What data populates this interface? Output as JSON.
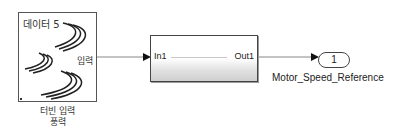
{
  "diagram": {
    "source_block": {
      "title": "데이터 5",
      "port_label": "입력",
      "caption_line1": "터빈 입력",
      "caption_line2": "풍력",
      "icon": "wind-icon"
    },
    "subsystem_block": {
      "input_port": "In1",
      "output_port": "Out1"
    },
    "outport_block": {
      "number": "1",
      "name": "Motor_Speed_Reference"
    },
    "colors": {
      "wire": "#888888",
      "arrow": "#111111",
      "block_border": "#444444"
    }
  }
}
